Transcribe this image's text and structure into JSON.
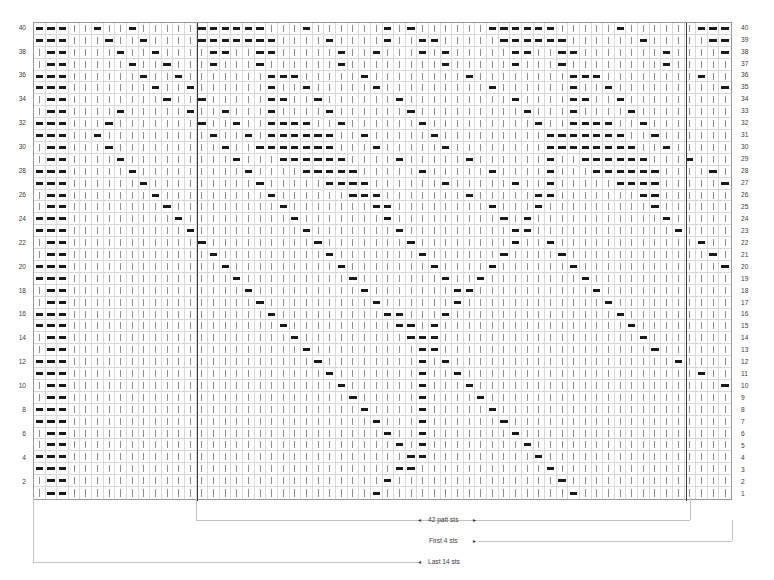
{
  "chart": {
    "columns": 60,
    "rows": 40,
    "symbols": {
      "k": "knit-stitch",
      "p": "purl-stitch"
    },
    "legend": {
      "knit": "knit",
      "purl": "purl"
    },
    "row_numbers_left": [
      "40",
      "38",
      "36",
      "34",
      "32",
      "30",
      "28",
      "26",
      "24",
      "22",
      "20",
      "18",
      "16",
      "14",
      "12",
      "10",
      "8",
      "6",
      "4",
      "2"
    ],
    "row_numbers_right": [
      "40",
      "39",
      "38",
      "37",
      "36",
      "35",
      "34",
      "33",
      "32",
      "31",
      "30",
      "29",
      "28",
      "27",
      "26",
      "25",
      "24",
      "23",
      "22",
      "21",
      "20",
      "19",
      "18",
      "17",
      "16",
      "15",
      "14",
      "13",
      "12",
      "11",
      "10",
      "9",
      "8",
      "7",
      "6",
      "5",
      "4",
      "3",
      "2",
      "1"
    ],
    "repeat": {
      "patt_start_col": 14,
      "patt_end_col": 56,
      "patt_label": "42 patt sts",
      "first_label": "First 4 sts",
      "last_label": "Last 14 sts",
      "arrow_left": "◂",
      "arrow_right": "▸"
    },
    "colors": {
      "purl": "#1a1a1a",
      "knit": "#8e8e8e",
      "grid_line": "#d9d9d9",
      "border": "#9a9a9a",
      "repeat_line": "#3a3a3a",
      "bracket": "#c2c2c2",
      "text": "#3c3c3c",
      "background": "#ffffff"
    },
    "grid_rows": [
      "pppkkpkkpkkkkkppppppkkkpkkkkkkpkpkkkkkkppppppkkkkkpkkkkkkppp",
      "pppkkkpkkpkkkkpppppppkkkkpkkkkpkkppkkkkkppppppkkkkkkpkkkkkpp",
      "kppkkkkpkkpkkkkppkkppkkkkkpkkpkkkpkpkkkkkppkkppkkkkkkkpkkkkp",
      "kppkkkkkpkkpkkkpkkkpkkkkkkpkkkkkkkkpkkkkkpkkkpkkkkkkkkpkkkkk",
      "pppkkkkkkpkkpkkkkkkkpppkkkkkpkkkkkkkkpkkkkkkkkpppkkkkkkkkpkk",
      "pppkkkkkkkpkkpkkkkkkpkkpkkkkkpkkkkkkkkkpkkkkkkpkkpkkkkkkkkkp",
      "kppkkkkkkkkpkkpkkkkkppkkpkkkkkkpkkkkkkkkkpkkkkppkkpkkkkkkkkk",
      "kppkkkkpkkkkkpkkpkkkpkkkkpkkkkkkpkkkkkkkkkpkkkpkkkkpkkkkkkkk",
      "pppkkkpkkkkkkkpkkpkkppppkkpkkkkkkpkkkkkkkkkpkkppppkkpkkkkkkk",
      "pppkkpkkkkkkkkkpkkpkppppppkkpkkkkkpkkkkkkkkkpppppppkkpkkkkkk",
      "kppkkkpkkkkkkkkkpkkpppppppkkkpkkkkkpkkkkkkkkppppppppkkpkkkkk",
      "kppkkkkpkkkkkkkkkpkkkppppppkkkkpkkkkkpkkkkkkpkkppppppkkkpkkk",
      "pppkkkkkpkkkkkkkkkpkkkkpppppkkkkkpkkkkkpkkkkpkkkppppppkkkkpk",
      "pppkkkkkkpkkkkkkkkkpkkkkkppppkkkkkkpkkkkkpkkpkkkkkppppkkkkkp",
      "kppkkkkkkkpkkkkkkkkkpkkkkkkpppkkkkkkkpkkkkkppkkkkkkkppkkkkkk",
      "kppkkkkkkkkpkkkkkkkkkpkkkkkkkppkkkkkkkkpkkkpkkkkkkkkkpkkkkkk",
      "pppkkkkkkkkkpkkkkkkkkkpkkkkkkkpkkkkkkkkkpkpkkkkkkkkkkkpkkkkk",
      "pppkkkkkkkkkkpkkkkkkkkkpkkkkkkkpkkkkkkkkkppkkkkkkkkkkkkpkkkk",
      "kppkkkkkkkkkkkpkkkkkkkkkpkkkkkkkpkkkkkkkkpkkpkkkkkkkkkkkkpkk",
      "kppkkkkkkkkkkkkpkkkkkkkkkpkkkkkkkpkkkkkkpkkkkpkkkkkkkkkkkkpk",
      "pppkkkkkkkkkkkkkpkkkkkkkkkpkkkkkkkpkkkkpkkkkkkpkkkkkkkkkkkkp",
      "pppkkkkkkkkkkkkkkpkkkkkkkkkpkkkkkkkpkkpkkkkkkkkpkkkkkkkkkkkk",
      "kppkkkkkkkkkkkkkkkpkkkkkkkkkpkkkkkkkppkkkkkkkkkkpkkkkkkkkkkk",
      "kppkkkkkkkkkkkkkkkkpkkkkkkkkkpkkkkkkpkkkkkkkkkkkkpkkkkkkkkkk",
      "pppkkkkkkkkkkkkkkkkkpkkkkkkkkkppkkkpkkkkkkkkkkkkkkpkkkkkkkkk",
      "pppkkkkkkkkkkkkkkkkkkpkkkkkkkkkppkpkkkkkkkkkkkkkkkkpkkkkkkkk",
      "kppkkkkkkkkkkkkkkkkkkkpkkkkkkkkkpppkkkkkkkkkkkkkkkkkpkkkkkkk",
      "kppkkkkkkkkkkkkkkkkkkkkpkkkkkkkkkppkkkkkkkkkkkkkkkkkkpkkkkkk",
      "pppkkkkkkkkkkkkkkkkkkkkkpkkkkkkkkpkpkkkkkkkkkkkkkkkkkkkpkkkk",
      "pppkkkkkkkkkkkkkkkkkkkkkkpkkkkkkkpkkpkkkkkkkkkkkkkkkkkkkkpkk",
      "kppkkkkkkkkkkkkkkkkkkkkkkkpkkkkkkpkkkpkkkkkkkkkkkkkkkkkkkkkp",
      "kppkkkkkkkkkkkkkkkkkkkkkkkkpkkkkkpkkkkpkkkkkkkkkkkkkkkkkkkkk",
      "pppkkkkkkkkkkkkkkkkkkkkkkkkkpkkkkpkkkkkpkkkkkkkkkkkkkkkkkkkk",
      "pppkkkkkkkkkkkkkkkkkkkkkkkkkkpkkkpkkkkkkpkkkkkkkkkkkkkkkkkkk",
      "kppkkkkkkkkkkkkkkkkkkkkkkkkkkkpkkpkkkkkkkpkkkkkkkkkkkkkkkkkk",
      "kppkkkkkkkkkkkkkkkkkkkkkkkkkkkkpkpkkkkkkkkpkkkkkkkkkkkkkkkkk",
      "pppkkkkkkkkkkkkkkkkkkkkkkkkkkkkkppkkkkkkkkkpkkkkkkkkkkkkkkkk",
      "pppkkkkkkkkkkkkkkkkkkkkkkkkkkkkppkkkkkkkkkkkpkkkkkkkkkkkkkkk",
      "kppkkkkkkkkkkkkkkkkkkkkkkkkkkkpkkkkkkkkkkkkkkpkkkkkkkkkkkkkk",
      "kppkkkkkkkkkkkkkkkkkkkkkkkkkkpkkkkkkkkkkkkkkkkpkkkkkkkkkkkkk"
    ]
  }
}
